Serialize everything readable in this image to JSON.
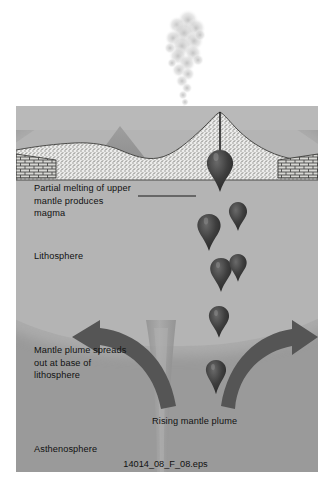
{
  "figure": {
    "caption": "14014_08_F_08.eps"
  },
  "labels": {
    "partial_melting": "Partial melting of upper\nmantle produces\nmagma",
    "lithosphere": "Lithosphere",
    "mantle_plume_spreads": "Mantle plume spreads\nout at base of\nlithosphere",
    "rising_mantle_plume": "Rising mantle plume",
    "asthenosphere": "Asthenosphere"
  },
  "elements": {
    "volcano": "volcano-cone",
    "seamount": "secondary-seamount",
    "smoke_plume": "eruption-smoke-column",
    "conduit": "magma-conduit",
    "magma_blobs": "magma-droplets",
    "layered_crust_left": "layered-crust-brick-left",
    "layered_crust_right": "layered-crust-brick-right",
    "arrow_left": "plume-spread-arrow-left",
    "arrow_right": "plume-spread-arrow-right",
    "plume_column": "rising-plume-column",
    "leader_line": "callout-leader-line"
  },
  "colors": {
    "asthenosphere": "#9a9a9a",
    "lithosphere_dome": "#b4b4b4",
    "water": "#b9b9b9",
    "crust_stipple": "#e7e7e4",
    "magma": "#3a3a3a",
    "arrow": "#545454",
    "text": "#111111",
    "background": "#ffffff"
  }
}
